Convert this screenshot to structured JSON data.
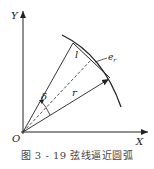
{
  "figure": {
    "caption": "图 3 - 19   弦线逼近圆弧",
    "labels": {
      "y_axis": "Y",
      "x_axis": "X",
      "origin": "O",
      "chord": "l",
      "error": "e",
      "error_sub": "r",
      "radius": "r",
      "angle": "δ"
    },
    "colors": {
      "stroke": "#222222",
      "background": "#ffffff"
    }
  }
}
